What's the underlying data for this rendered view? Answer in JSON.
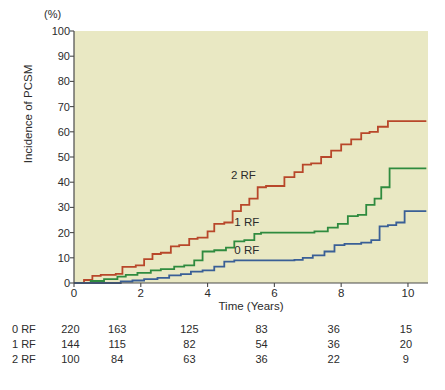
{
  "axes": {
    "y_unit": "(%)",
    "y_title": "Incidence of PCSM",
    "x_title": "Time (Years)",
    "y_ticks": [
      "0",
      "10",
      "20",
      "30",
      "40",
      "50",
      "60",
      "70",
      "80",
      "90",
      "100"
    ],
    "x_ticks": [
      "0",
      "2",
      "4",
      "6",
      "8",
      "10"
    ]
  },
  "curve_labels": {
    "two_rf": "2 RF",
    "one_rf": "1 RF",
    "zero_rf": "0 RF"
  },
  "risk_table": {
    "rows": [
      {
        "label": "0 RF",
        "values": [
          "220",
          "163",
          "125",
          "83",
          "36",
          "15"
        ]
      },
      {
        "label": "1 RF",
        "values": [
          "144",
          "115",
          "82",
          "54",
          "36",
          "20"
        ]
      },
      {
        "label": "2 RF",
        "values": [
          "100",
          "84",
          "63",
          "36",
          "22",
          "9"
        ]
      }
    ]
  },
  "colors": {
    "plot_background": "#e9e8c3",
    "two_rf": "#b8472a",
    "one_rf": "#2f8b3f",
    "zero_rf": "#3a5f96",
    "axis": "#4a4a4a",
    "text": "#2b2b2b"
  },
  "chart_data": {
    "type": "line",
    "title": "",
    "subtitle": "",
    "xlabel": "Time (Years)",
    "ylabel": "Incidence of PCSM",
    "y_unit": "(%)",
    "xlim": [
      0,
      10.6
    ],
    "ylim": [
      0,
      100
    ],
    "grid": false,
    "legend": "inline-annotations",
    "step_style": "post",
    "annotations": [
      {
        "text": "2 RF",
        "x": 5.0,
        "y": 42.5
      },
      {
        "text": "1 RF",
        "x": 5.1,
        "y": 24.0
      },
      {
        "text": "0 RF",
        "x": 5.1,
        "y": 12.8
      }
    ],
    "series": [
      {
        "name": "2 RF",
        "color": "#b8472a",
        "x": [
          0,
          0.3,
          0.55,
          0.8,
          1.25,
          1.45,
          1.85,
          2.1,
          2.35,
          2.6,
          2.9,
          3.15,
          3.45,
          3.7,
          4.0,
          4.2,
          4.5,
          4.75,
          5.0,
          5.25,
          5.5,
          5.75,
          6.3,
          6.6,
          6.85,
          7.1,
          7.4,
          7.7,
          8.0,
          8.3,
          8.6,
          8.85,
          9.1,
          9.4,
          10.55
        ],
        "y": [
          0,
          1.2,
          2.8,
          3.2,
          3.6,
          6.4,
          7.0,
          9.5,
          11.5,
          12.0,
          14.5,
          15.0,
          17.5,
          18.0,
          20.5,
          23.5,
          24.0,
          28.5,
          31.0,
          33.5,
          38.0,
          38.5,
          42.0,
          44.0,
          47.0,
          47.5,
          50.0,
          52.5,
          55.0,
          57.0,
          59.5,
          60.0,
          62.0,
          64.2,
          64.2
        ]
      },
      {
        "name": "1 RF",
        "color": "#2f8b3f",
        "x": [
          0,
          0.5,
          0.9,
          1.3,
          1.55,
          1.9,
          2.3,
          2.6,
          3.0,
          3.3,
          3.6,
          3.85,
          4.2,
          4.55,
          4.8,
          5.1,
          5.4,
          5.6,
          7.2,
          7.6,
          7.9,
          8.2,
          8.5,
          8.75,
          9.0,
          9.2,
          9.45,
          10.55
        ],
        "y": [
          0,
          0.8,
          1.5,
          2.5,
          3.2,
          4.0,
          5.0,
          5.5,
          6.5,
          7.0,
          9.0,
          12.5,
          13.0,
          14.0,
          16.5,
          17.0,
          19.5,
          20.0,
          20.5,
          22.0,
          23.5,
          26.5,
          27.0,
          31.0,
          33.5,
          38.0,
          45.5,
          45.5
        ]
      },
      {
        "name": "0 RF",
        "color": "#3a5f96",
        "x": [
          0,
          1.4,
          1.75,
          2.1,
          2.5,
          2.85,
          3.2,
          3.5,
          3.85,
          4.2,
          4.5,
          4.8,
          6.6,
          6.85,
          7.15,
          7.5,
          7.8,
          8.1,
          8.6,
          8.9,
          9.15,
          9.4,
          9.65,
          9.9,
          10.55
        ],
        "y": [
          0,
          0.6,
          1.0,
          1.5,
          2.0,
          3.0,
          3.5,
          4.5,
          5.0,
          6.5,
          8.5,
          9.0,
          9.2,
          10.0,
          11.0,
          12.5,
          15.0,
          15.5,
          16.0,
          17.0,
          22.5,
          23.0,
          24.0,
          28.5,
          28.5
        ]
      }
    ]
  }
}
